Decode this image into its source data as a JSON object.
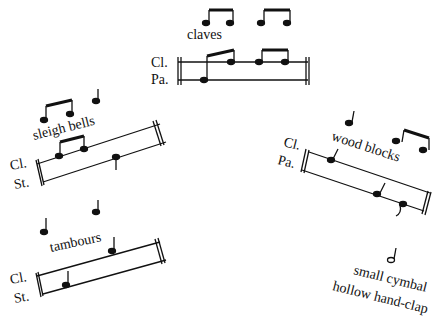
{
  "figures": {
    "claves": {
      "title": "claves",
      "staff_labels": [
        "Cl.",
        "Pa."
      ]
    },
    "sleigh_bells": {
      "title": "sleigh bells",
      "staff_labels": [
        "Cl.",
        "St."
      ]
    },
    "wood_blocks": {
      "title": "wood blocks",
      "staff_labels": [
        "Cl.",
        "Pa."
      ]
    },
    "tambours": {
      "title": "tambours",
      "staff_labels": [
        "Cl.",
        "St."
      ]
    },
    "small_cymbal": {
      "title_line1": "small cymbal",
      "title_line2": "hollow hand-clap"
    }
  }
}
